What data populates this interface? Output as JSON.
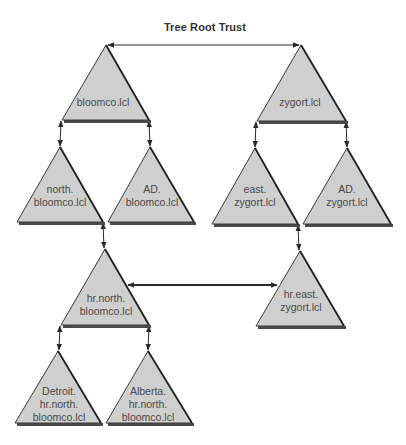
{
  "diagram": {
    "title": "Tree Root Trust",
    "colors": {
      "triangle_fill": "#cfcfcf",
      "triangle_stroke": "#3a3a3a",
      "base_shadow": "#4a4a4a",
      "arrow": "#2a2a2a",
      "text": "#4a4a4a"
    },
    "nodes": [
      {
        "id": "bloomco",
        "label": "bloomco.lcl",
        "apex": [
          106,
          45
        ],
        "left": [
          62,
          120
        ],
        "right": [
          149,
          120
        ],
        "label_pos": [
          103,
          102
        ]
      },
      {
        "id": "zygort",
        "label": "zygort.lcl",
        "apex": [
          301,
          45
        ],
        "left": [
          257,
          121
        ],
        "right": [
          346,
          121
        ],
        "label_pos": [
          300,
          102
        ]
      },
      {
        "id": "north-bloomco",
        "label": "north.\nbloomco.lcl",
        "apex": [
          60,
          147
        ],
        "left": [
          17,
          222
        ],
        "right": [
          103,
          222
        ],
        "label_pos": [
          60,
          196
        ]
      },
      {
        "id": "ad-bloomco",
        "label": "AD.\nbloomco.lcl",
        "apex": [
          150,
          147
        ],
        "left": [
          108,
          222
        ],
        "right": [
          194,
          222
        ],
        "label_pos": [
          152,
          196
        ]
      },
      {
        "id": "east-zygort",
        "label": "east.\nzygort.lcl",
        "apex": [
          255,
          148
        ],
        "left": [
          212,
          224
        ],
        "right": [
          298,
          224
        ],
        "label_pos": [
          255,
          196
        ]
      },
      {
        "id": "ad-zygort",
        "label": "AD.\nzygort.lcl",
        "apex": [
          347,
          148
        ],
        "left": [
          303,
          224
        ],
        "right": [
          391,
          224
        ],
        "label_pos": [
          347,
          196
        ]
      },
      {
        "id": "hr-north-bloomco",
        "label": "hr.north.\nbloomco.lcl",
        "apex": [
          105,
          249
        ],
        "left": [
          61,
          325
        ],
        "right": [
          149,
          325
        ],
        "label_pos": [
          106,
          305
        ]
      },
      {
        "id": "hr-east-zygort",
        "label": "hr.east.\nzygort.lcl",
        "apex": [
          300,
          251
        ],
        "left": [
          256,
          326
        ],
        "right": [
          344,
          326
        ],
        "label_pos": [
          301,
          301
        ]
      },
      {
        "id": "detroit",
        "label": "Detroit.\nhr.north.\nbloomco.lcl",
        "apex": [
          58,
          351
        ],
        "left": [
          15,
          423
        ],
        "right": [
          101,
          423
        ],
        "label_pos": [
          59,
          404
        ]
      },
      {
        "id": "alberta",
        "label": "Alberta.\nhr.north.\nbloomco.lcl",
        "apex": [
          148,
          351
        ],
        "left": [
          106,
          423
        ],
        "right": [
          192,
          423
        ],
        "label_pos": [
          148,
          404
        ]
      }
    ],
    "trusts": [
      {
        "id": "tree-root-trust",
        "from": [
          108,
          45
        ],
        "to": [
          299,
          45
        ],
        "type": "two-way",
        "weight": 1.2
      },
      {
        "id": "bloomco-north",
        "from": [
          61,
          121
        ],
        "to": [
          60,
          146
        ],
        "type": "two-way",
        "weight": 1
      },
      {
        "id": "bloomco-ad",
        "from": [
          149,
          121
        ],
        "to": [
          150,
          146
        ],
        "type": "two-way",
        "weight": 1
      },
      {
        "id": "zygort-east",
        "from": [
          256,
          122
        ],
        "to": [
          255,
          147
        ],
        "type": "two-way",
        "weight": 1
      },
      {
        "id": "zygort-ad",
        "from": [
          346,
          122
        ],
        "to": [
          347,
          147
        ],
        "type": "two-way",
        "weight": 1
      },
      {
        "id": "north-hr-north",
        "from": [
          103,
          223
        ],
        "to": [
          104,
          248
        ],
        "type": "two-way",
        "weight": 1
      },
      {
        "id": "east-hr-east",
        "from": [
          298,
          225
        ],
        "to": [
          299,
          250
        ],
        "type": "two-way",
        "weight": 1
      },
      {
        "id": "shortcut-trust",
        "from": [
          128,
          285
        ],
        "to": [
          277,
          285
        ],
        "type": "two-way",
        "weight": 2
      },
      {
        "id": "hr-north-detroit",
        "from": [
          60,
          326
        ],
        "to": [
          59,
          350
        ],
        "type": "two-way",
        "weight": 1
      },
      {
        "id": "hr-north-alberta",
        "from": [
          149,
          326
        ],
        "to": [
          148,
          350
        ],
        "type": "two-way",
        "weight": 1
      }
    ]
  }
}
